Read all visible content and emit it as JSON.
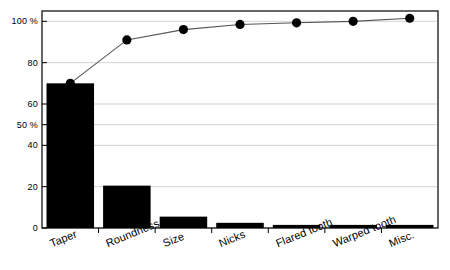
{
  "chart_data": {
    "type": "bar",
    "title": "",
    "subtitle": "",
    "xlabel": "",
    "ylabel": "",
    "categories": [
      "Taper",
      "Roundness",
      "Size",
      "Nicks",
      "Flared tooth",
      "Warped tooth",
      "Misc."
    ],
    "values": [
      70,
      20.5,
      5.5,
      2.5,
      1.5,
      1.5,
      1.5
    ],
    "series": [
      {
        "name": "Count (%)",
        "type": "bar",
        "values": [
          70,
          20.5,
          5.5,
          2.5,
          1.5,
          1.5,
          1.5
        ]
      },
      {
        "name": "Cumulative (%)",
        "type": "line",
        "values": [
          70,
          91,
          96,
          98.5,
          99.3,
          100,
          101.5
        ]
      }
    ],
    "ylim": [
      0,
      105
    ],
    "y_ticks": [
      0,
      20,
      40,
      50,
      60,
      80,
      100
    ],
    "y_tick_labels": [
      "0",
      "20",
      "40",
      "50 %",
      "60",
      "80",
      "100 %"
    ],
    "grid": true,
    "grid_axis": "y",
    "legend": "none",
    "bar_color": "#000000",
    "line_color": "#555555",
    "marker_color": "#000000",
    "grid_color": "#c8c8c8",
    "axis_color": "#000000",
    "background_color": "#ffffff",
    "x_tick_rotation": -22
  },
  "axes": {
    "y_labels": [
      "100 %",
      "80",
      "60",
      "50 %",
      "40",
      "20",
      "0"
    ],
    "x_labels": [
      "Taper",
      "Roundness",
      "Size",
      "Nicks",
      "Flared tooth",
      "Warped tooth",
      "Misc."
    ]
  }
}
